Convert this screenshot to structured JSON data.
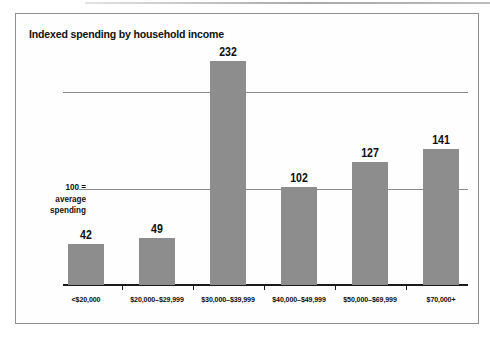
{
  "chart": {
    "title": "Indexed spending by household income",
    "annotation": {
      "line1": "100 =",
      "line2": "average",
      "line3": "spending"
    }
  },
  "chart_data": {
    "type": "bar",
    "title": "Indexed spending by household income",
    "categories": [
      "<$20,000",
      "$20,000–$29,999",
      "$30,000–$39,999",
      "$40,000–$49,999",
      "$50,000–$69,999",
      "$70,000+"
    ],
    "values": [
      42,
      49,
      232,
      102,
      127,
      141
    ],
    "xlabel": "household income",
    "ylabel": "indexed spending (100 = average spending)",
    "ylim": [
      0,
      240
    ],
    "gridlines": [
      100,
      200
    ],
    "grid": "horizontal reference lines at 100 and 200, no y-axis tick labels",
    "legend": "none",
    "data_labels": "value shown above each bar",
    "bar_color": "#8d8d8d",
    "axis_color": "#1a1a1a",
    "gridline_color": "#8a8a8a"
  }
}
